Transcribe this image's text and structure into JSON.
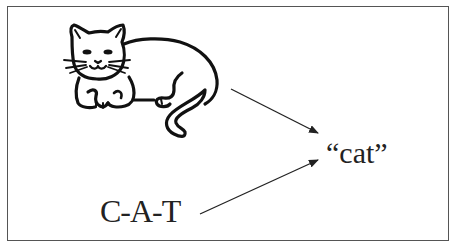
{
  "diagram": {
    "picture": {
      "subject": "cat",
      "icon": "cat-drawing-icon"
    },
    "word_label": "“cat”",
    "spelling_label": "C-A-T",
    "arrows": [
      {
        "from": "cat-drawing",
        "to": "word-label"
      },
      {
        "from": "spelling-label",
        "to": "word-label"
      }
    ],
    "colors": {
      "stroke": "#111111",
      "frame": "#555555",
      "text": "#222222"
    }
  }
}
